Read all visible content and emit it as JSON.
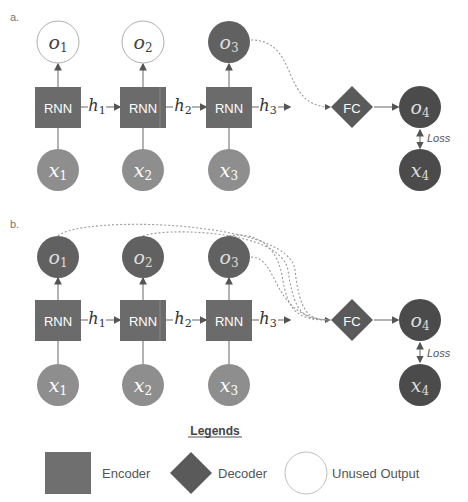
{
  "colors": {
    "encoder": "#6b6b6b",
    "input": "#8e8e8e",
    "output_used": "#616161",
    "target": "#4b4b4b",
    "decoder": "#5a5a5a",
    "unused_stroke": "#b0b0b0",
    "line": "#8a8a8a",
    "dotted": "#9a9a9a",
    "text_dark": "#555555"
  },
  "panel_a": {
    "label": "a.",
    "rnn_label": "RNN",
    "hidden": [
      "h",
      "h",
      "h"
    ],
    "hidden_sub": [
      "1",
      "2",
      "3"
    ],
    "outputs": [
      "o",
      "o",
      "o"
    ],
    "outputs_sub": [
      "1",
      "2",
      "3"
    ],
    "inputs": [
      "x",
      "x",
      "x"
    ],
    "inputs_sub": [
      "1",
      "2",
      "3"
    ],
    "fc_label": "FC",
    "o4": "o",
    "o4_sub": "4",
    "x4": "x",
    "x4_sub": "4",
    "loss_label": "Loss"
  },
  "panel_b": {
    "label": "b.",
    "rnn_label": "RNN",
    "hidden": [
      "h",
      "h",
      "h"
    ],
    "hidden_sub": [
      "1",
      "2",
      "3"
    ],
    "outputs": [
      "o",
      "o",
      "o"
    ],
    "outputs_sub": [
      "1",
      "2",
      "3"
    ],
    "inputs": [
      "x",
      "x",
      "x"
    ],
    "inputs_sub": [
      "1",
      "2",
      "3"
    ],
    "fc_label": "FC",
    "o4": "o",
    "o4_sub": "4",
    "x4": "x",
    "x4_sub": "4",
    "loss_label": "Loss"
  },
  "legend": {
    "title": "Legends",
    "items": [
      {
        "label": "Encoder",
        "shape": "square"
      },
      {
        "label": "Decoder",
        "shape": "diamond"
      },
      {
        "label": "Unused Output",
        "shape": "circle"
      }
    ]
  }
}
